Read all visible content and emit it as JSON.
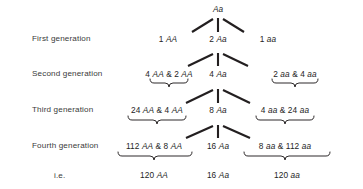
{
  "figure": {
    "type": "genetics-inheritance-diagram",
    "background_color": "#ffffff",
    "ink_color": "#231f20",
    "root": {
      "label": "Aa"
    },
    "row_labels": [
      "First generation",
      "Second generation",
      "Third generation",
      "Fourth generation",
      "i.e."
    ],
    "rows": [
      {
        "label": "First generation",
        "cells": [
          "1 AA",
          "2 Aa",
          "1 aa"
        ]
      },
      {
        "label": "Second generation",
        "cells": [
          "4 AA & 2 AA",
          "4 Aa",
          "2 aa & 4 aa"
        ]
      },
      {
        "label": "Third generation",
        "cells": [
          "24 AA & 4 AA",
          "8 Aa",
          "4 aa & 24 aa"
        ]
      },
      {
        "label": "Fourth generation",
        "cells": [
          "112 AA & 8 AA",
          "16 Aa",
          "8 aa & 112 aa"
        ]
      },
      {
        "label": "i.e.",
        "cells": [
          "120 AA",
          "16 Aa",
          "120 aa"
        ]
      }
    ]
  },
  "chart_data": {
    "type": "diagram",
    "title": "",
    "root_genotype": "Aa",
    "generations": [
      {
        "name": "First generation",
        "homozygous_dominant": "1 AA",
        "heterozygous": "2 Aa",
        "homozygous_recessive": "1 aa"
      },
      {
        "name": "Second generation",
        "homozygous_dominant": "4 AA & 2 AA",
        "heterozygous": "4 Aa",
        "homozygous_recessive": "2 aa & 4 aa"
      },
      {
        "name": "Third generation",
        "homozygous_dominant": "24 AA & 4 AA",
        "heterozygous": "8 Aa",
        "homozygous_recessive": "4 aa & 24 aa"
      },
      {
        "name": "Fourth generation",
        "homozygous_dominant": "112 AA & 8 AA",
        "heterozygous": "16 Aa",
        "homozygous_recessive": "8 aa & 112 aa"
      },
      {
        "name": "i.e.",
        "homozygous_dominant": "120 AA",
        "heterozygous": "16 Aa",
        "homozygous_recessive": "120 aa"
      }
    ]
  }
}
